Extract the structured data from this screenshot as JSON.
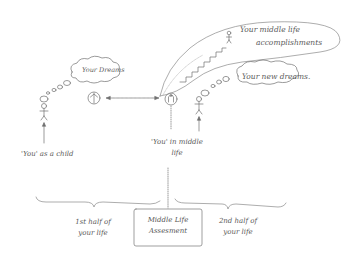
{
  "diagram": {
    "nodes": {
      "child": {
        "label": "'You' as a child"
      },
      "your_dreams": {
        "label": "Your Dreams"
      },
      "child_figure_marker": {
        "label": "A"
      },
      "middle_figure_marker": {
        "label": "B"
      },
      "middle_life_you": {
        "label": "'You' in middle life"
      },
      "accomplishments": {
        "label_line1": "Your middle life",
        "label_line2": "accomplishments"
      },
      "new_dreams": {
        "label": "Your new dreams."
      },
      "assessment_box": {
        "label_line1": "Middle Life",
        "label_line2": "Assesment"
      },
      "first_half": {
        "label_line1": "1st half of",
        "label_line2": "your life"
      },
      "second_half": {
        "label_line1": "2nd half of",
        "label_line2": "your life"
      }
    },
    "edges": [
      {
        "from": "child_figure_marker",
        "to": "middle_figure_marker",
        "type": "bidirectional-arrow"
      },
      {
        "from": "middle_life_you",
        "to": "assessment_box",
        "type": "dotted-line"
      }
    ],
    "colors": {
      "ink": "#6a6a6a",
      "light_ink": "#9a9a9a",
      "background": "#ffffff"
    }
  }
}
